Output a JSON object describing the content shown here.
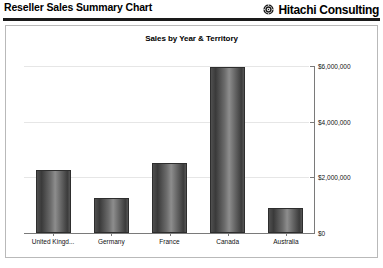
{
  "header": {
    "report_title": "Reseller Sales Summary Chart",
    "brand_name": "Hitachi Consulting",
    "brand_mark": "hitachi-logo-icon"
  },
  "chart_data": {
    "type": "bar",
    "title": "Sales by Year & Territory",
    "xlabel": "",
    "ylabel": "",
    "categories": [
      "United Kingd...",
      "Germany",
      "France",
      "Canada",
      "Australia"
    ],
    "values": [
      2250000,
      1270000,
      2500000,
      5980000,
      910000
    ],
    "ylim": [
      0,
      6000000
    ],
    "ytick_values": [
      0,
      2000000,
      4000000,
      6000000
    ],
    "ytick_labels": [
      "$0",
      "$2,000,000",
      "$4,000,000",
      "$6,000,000"
    ],
    "grid": true,
    "legend": "none",
    "bar_style": "cylinder-gradient",
    "series": [
      {
        "name": "Sales",
        "values": [
          2250000,
          1270000,
          2500000,
          5980000,
          910000
        ]
      }
    ],
    "colors": {
      "bar_dark": "#3a3a3a",
      "bar_highlight": "#8d8d8d",
      "gridline": "#e6e6e6",
      "axis": "#7a7a7a",
      "panel_border": "#b9b9b9",
      "header_rule": "#1a1a1a"
    }
  }
}
